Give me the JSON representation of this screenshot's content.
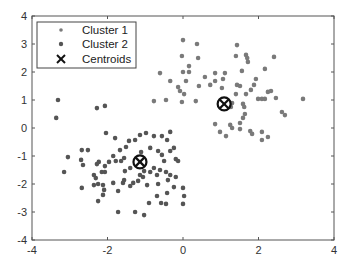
{
  "chart_data": {
    "type": "scatter",
    "title": "",
    "xlabel": "",
    "ylabel": "",
    "xlim": [
      -4,
      4
    ],
    "ylim": [
      -4,
      4
    ],
    "xticks": [
      -4,
      -2,
      0,
      2,
      4
    ],
    "yticks": [
      -4,
      -3,
      -2,
      -1,
      0,
      1,
      2,
      3,
      4
    ],
    "grid": false,
    "legend_position": "upper-left",
    "series": [
      {
        "name": "Cluster 1",
        "marker": "dot",
        "color": "#7a7a7a",
        "points": [
          [
            0.0,
            3.14
          ],
          [
            0.37,
            3.0
          ],
          [
            -0.03,
            2.57
          ],
          [
            0.4,
            2.5
          ],
          [
            0.16,
            2.21
          ],
          [
            0.0,
            2.0
          ],
          [
            0.16,
            2.0
          ],
          [
            -0.61,
            1.96
          ],
          [
            0.58,
            1.82
          ],
          [
            -0.34,
            1.68
          ],
          [
            0.08,
            1.68
          ],
          [
            0.42,
            1.5
          ],
          [
            -0.13,
            1.46
          ],
          [
            -0.08,
            1.32
          ],
          [
            0.03,
            1.21
          ],
          [
            0.85,
            1.96
          ],
          [
            0.85,
            1.68
          ],
          [
            0.72,
            1.54
          ],
          [
            -0.77,
            0.96
          ],
          [
            -0.45,
            1.0
          ],
          [
            -0.03,
            0.93
          ],
          [
            0.34,
            0.96
          ],
          [
            1.43,
            2.96
          ],
          [
            1.4,
            2.57
          ],
          [
            1.67,
            2.61
          ],
          [
            1.7,
            2.5
          ],
          [
            1.72,
            2.36
          ],
          [
            2.41,
            2.54
          ],
          [
            1.11,
            1.96
          ],
          [
            1.56,
            2.04
          ],
          [
            2.17,
            2.11
          ],
          [
            1.06,
            1.75
          ],
          [
            1.93,
            1.75
          ],
          [
            1.43,
            1.54
          ],
          [
            1.51,
            1.5
          ],
          [
            1.88,
            1.54
          ],
          [
            1.03,
            1.43
          ],
          [
            1.8,
            1.36
          ],
          [
            1.67,
            1.21
          ],
          [
            2.25,
            1.29
          ],
          [
            2.33,
            1.32
          ],
          [
            2.09,
            1.04
          ],
          [
            2.17,
            1.04
          ],
          [
            2.46,
            1.07
          ],
          [
            3.18,
            1.04
          ],
          [
            1.3,
            0.89
          ],
          [
            1.59,
            0.86
          ],
          [
            1.62,
            0.75
          ],
          [
            1.99,
            1.04
          ],
          [
            1.4,
            1.21
          ],
          [
            2.62,
            0.57
          ],
          [
            2.7,
            0.46
          ],
          [
            2.09,
            -0.14
          ],
          [
            2.09,
            -0.43
          ],
          [
            2.25,
            -0.32
          ],
          [
            1.27,
            0.75
          ],
          [
            1.64,
            0.5
          ],
          [
            1.59,
            0.36
          ],
          [
            1.51,
            0.18
          ],
          [
            0.85,
            0.14
          ],
          [
            1.3,
            0.0
          ],
          [
            1.78,
            -0.11
          ],
          [
            1.83,
            -0.21
          ],
          [
            1.51,
            -0.04
          ],
          [
            1.14,
            -0.29
          ],
          [
            1.25,
            0.11
          ],
          [
            0.98,
            -0.14
          ]
        ]
      },
      {
        "name": "Cluster 2",
        "marker": "dot",
        "color": "#555555",
        "points": [
          [
            -2.04,
            -0.18
          ],
          [
            -1.8,
            -0.36
          ],
          [
            -1.43,
            -0.46
          ],
          [
            -1.51,
            -0.68
          ],
          [
            -1.67,
            -0.79
          ],
          [
            -1.85,
            -1.0
          ],
          [
            -3.05,
            -1.04
          ],
          [
            -2.68,
            -0.79
          ],
          [
            -2.52,
            -0.79
          ],
          [
            -2.7,
            -1.14
          ],
          [
            -2.23,
            -1.21
          ],
          [
            -2.28,
            -1.29
          ],
          [
            -1.96,
            -1.21
          ],
          [
            -1.78,
            -1.18
          ],
          [
            -1.64,
            -1.18
          ],
          [
            -1.56,
            -1.07
          ],
          [
            -3.15,
            -1.57
          ],
          [
            -1.54,
            -1.54
          ],
          [
            -1.56,
            -1.86
          ],
          [
            -2.07,
            -1.57
          ],
          [
            -2.36,
            -1.68
          ],
          [
            -2.31,
            -1.79
          ],
          [
            -2.15,
            -1.57
          ],
          [
            -1.85,
            -1.96
          ],
          [
            -1.59,
            -1.96
          ],
          [
            -1.32,
            -1.96
          ],
          [
            -2.25,
            -2.0
          ],
          [
            -2.12,
            -2.04
          ],
          [
            -2.68,
            -2.14
          ],
          [
            -1.72,
            -2.25
          ],
          [
            -1.72,
            -3.0
          ],
          [
            -2.25,
            -2.61
          ],
          [
            -2.12,
            -2.39
          ],
          [
            -2.09,
            -2.21
          ],
          [
            -1.4,
            -2.07
          ],
          [
            -2.07,
            -1.36
          ],
          [
            -1.4,
            -1.43
          ],
          [
            -0.98,
            -0.18
          ],
          [
            -1.14,
            -0.25
          ],
          [
            -0.77,
            -0.29
          ],
          [
            -0.56,
            -0.29
          ],
          [
            -0.34,
            -0.14
          ],
          [
            -0.42,
            -0.43
          ],
          [
            -1.27,
            -0.43
          ],
          [
            -0.87,
            -0.71
          ],
          [
            -1.11,
            -0.86
          ],
          [
            -0.66,
            -0.82
          ],
          [
            -0.34,
            -0.82
          ],
          [
            -0.24,
            -0.71
          ],
          [
            -0.56,
            -0.96
          ],
          [
            -0.5,
            -1.18
          ],
          [
            -0.19,
            -1.11
          ],
          [
            -0.13,
            -1.18
          ],
          [
            -0.77,
            -1.43
          ],
          [
            -1.03,
            -1.54
          ],
          [
            -0.87,
            -1.57
          ],
          [
            -0.61,
            -1.5
          ],
          [
            -0.45,
            -1.57
          ],
          [
            -0.34,
            -1.68
          ],
          [
            -0.69,
            -1.68
          ],
          [
            -1.14,
            -1.68
          ],
          [
            -0.19,
            -1.75
          ],
          [
            -0.4,
            -1.86
          ],
          [
            -1.06,
            -1.75
          ],
          [
            -1.19,
            -1.89
          ],
          [
            -0.66,
            -2.0
          ],
          [
            -0.42,
            -2.32
          ],
          [
            -0.95,
            -2.04
          ],
          [
            -0.24,
            -2.11
          ],
          [
            -0.9,
            -2.68
          ],
          [
            0.0,
            -2.14
          ],
          [
            -0.69,
            -2.43
          ],
          [
            -0.58,
            -2.68
          ],
          [
            -1.03,
            -3.11
          ],
          [
            -1.27,
            -3.0
          ],
          [
            -0.45,
            -2.71
          ],
          [
            0.0,
            -2.71
          ],
          [
            0.03,
            -2.43
          ],
          [
            -3.31,
            1.0
          ],
          [
            -3.36,
            0.36
          ],
          [
            -2.28,
            0.71
          ],
          [
            -2.07,
            0.79
          ],
          [
            -2.65,
            -1.32
          ],
          [
            -2.36,
            -2.04
          ]
        ]
      },
      {
        "name": "Centroids",
        "marker": "x",
        "color": "#111111",
        "points": [
          [
            1.09,
            0.86
          ],
          [
            -1.14,
            -1.21
          ]
        ]
      }
    ]
  },
  "legend": {
    "items": [
      {
        "label": "Cluster 1",
        "symbol": "dot",
        "color": "#7a7a7a"
      },
      {
        "label": "Cluster 2",
        "symbol": "dot",
        "color": "#555555"
      },
      {
        "label": "Centroids",
        "symbol": "x",
        "color": "#111111"
      }
    ]
  },
  "axes": {
    "x_tick_labels": [
      "-4",
      "-2",
      "0",
      "2",
      "4"
    ],
    "y_tick_labels": [
      "-4",
      "-3",
      "-2",
      "-1",
      "0",
      "1",
      "2",
      "3",
      "4"
    ]
  }
}
